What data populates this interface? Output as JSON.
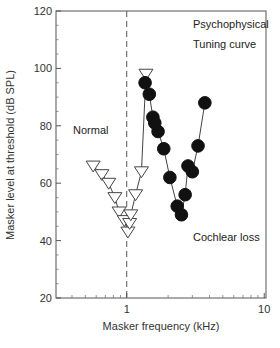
{
  "chart_data": {
    "type": "scatter",
    "title": "",
    "xlabel": "Masker frequency (kHz)",
    "ylabel": "Masker level at threshold (dB SPL)",
    "xscale": "log",
    "xlim": [
      0.306,
      10.3
    ],
    "ylim": [
      20,
      120
    ],
    "x_ticks": [
      {
        "value": 1,
        "label": "1"
      },
      {
        "value": 10,
        "label": "10"
      }
    ],
    "y_ticks": [
      {
        "value": 20,
        "label": "20"
      },
      {
        "value": 40,
        "label": "40"
      },
      {
        "value": 60,
        "label": "60"
      },
      {
        "value": 80,
        "label": "80"
      },
      {
        "value": 100,
        "label": "100"
      },
      {
        "value": 120,
        "label": "120"
      }
    ],
    "grid": false,
    "reference_line": {
      "x": 1,
      "style": "dashed",
      "orientation": "vertical"
    },
    "annotations": [
      {
        "text": "Psychophysical",
        "x": 2.3,
        "y": 112
      },
      {
        "text": "Tuning curve",
        "x": 2.3,
        "y": 105
      },
      {
        "text": "Normal",
        "x": 0.5,
        "y": 77
      },
      {
        "text": "Cochlear loss",
        "x": 2.3,
        "y": 40
      }
    ],
    "series": [
      {
        "name": "Normal",
        "marker": "open-triangle-down",
        "connected": true,
        "x": [
          0.57,
          0.66,
          0.74,
          0.82,
          0.88,
          0.96,
          1.02,
          1.05,
          1.07,
          1.16,
          1.28,
          1.38
        ],
        "y": [
          66,
          63,
          60,
          55,
          50,
          47,
          43,
          46,
          49,
          56,
          64,
          98
        ]
      },
      {
        "name": "Cochlear loss",
        "marker": "filled-circle",
        "connected": true,
        "x": [
          1.36,
          1.46,
          1.55,
          1.6,
          1.69,
          1.86,
          2.06,
          2.33,
          2.5,
          2.66,
          2.79,
          3.0,
          3.3,
          3.7
        ],
        "y": [
          95,
          91,
          83,
          81,
          78,
          72,
          62,
          52,
          49,
          56,
          66,
          64,
          73,
          88
        ]
      }
    ]
  }
}
